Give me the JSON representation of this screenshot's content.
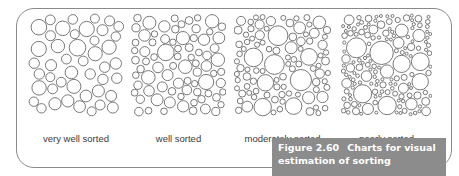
{
  "figure": {
    "number": "Figure 2.60",
    "title_line1": "Charts for visual",
    "title_line2": "estimation of sorting",
    "colors": {
      "frame": "#8a8a8a",
      "caption_bg": "#8c8c8c",
      "caption_text": "#ffffff",
      "circle_stroke": "#6a6a6a",
      "label": "#3a3a3a"
    }
  },
  "panels": [
    {
      "label": "very well sorted",
      "x": 28,
      "w": 96,
      "h": 102,
      "rmin": 4.5,
      "rmax": 8.5,
      "seed": 11
    },
    {
      "label": "well sorted",
      "x": 131,
      "w": 95,
      "h": 102,
      "rmin": 3.2,
      "rmax": 8.5,
      "seed": 23
    },
    {
      "label": "moderately sorted",
      "x": 234,
      "w": 97,
      "h": 102,
      "rmin": 2.5,
      "rmax": 11,
      "seed": 37
    },
    {
      "label": "poorly sorted",
      "x": 341,
      "w": 91,
      "h": 102,
      "rmin": 1.5,
      "rmax": 13.5,
      "seed": 51
    }
  ]
}
